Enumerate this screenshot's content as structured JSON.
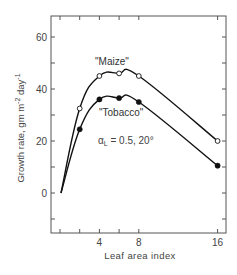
{
  "chart_data": {
    "type": "line",
    "title": "",
    "xlabel": "Leaf area index",
    "ylabel": "Growth rate, gm m^-2 day^-1",
    "ylabel_parts": {
      "main": "Growth rate, gm m",
      "exp1": "-2",
      "mid": " day",
      "exp2": "-1"
    },
    "xlim": [
      -1,
      17
    ],
    "ylim": [
      -15,
      68
    ],
    "x_ticks": [
      0,
      2,
      4,
      6,
      8,
      16
    ],
    "x_tick_labels": [
      {
        "value": 4,
        "label": "4"
      },
      {
        "value": 8,
        "label": "8"
      },
      {
        "value": 16,
        "label": "16"
      }
    ],
    "y_ticks": [
      -10,
      0,
      10,
      20,
      30,
      40,
      50,
      60
    ],
    "y_tick_labels": [
      {
        "value": 0,
        "label": "0"
      },
      {
        "value": 20,
        "label": "20"
      },
      {
        "value": 40,
        "label": "40"
      },
      {
        "value": 60,
        "label": "60"
      }
    ],
    "grid": false,
    "legend": "inline labels",
    "series": [
      {
        "name": "\"Maize\"",
        "marker": "open-circle",
        "curve_start": [
          0,
          0
        ],
        "x": [
          2,
          4,
          6,
          8,
          16
        ],
        "values": [
          32.5,
          45,
          46,
          45,
          20
        ]
      },
      {
        "name": "\"Tobacco\"",
        "marker": "filled-circle",
        "curve_start": [
          0,
          0
        ],
        "x": [
          2,
          4,
          6,
          8,
          16
        ],
        "values": [
          24.5,
          36,
          36.5,
          35,
          10.5
        ]
      }
    ],
    "annotations": [
      {
        "text_main": "α",
        "text_sub": "L",
        "text_rest": " = 0.5, 20°"
      }
    ]
  }
}
